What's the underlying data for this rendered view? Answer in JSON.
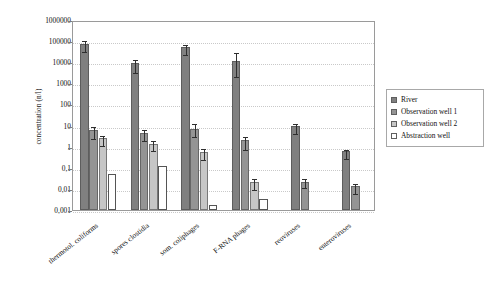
{
  "chart_data": {
    "type": "bar",
    "title": "",
    "subtitle": "",
    "xlabel": "",
    "ylabel": "concentration (n/l)",
    "yscale": "log",
    "ylim": [
      0.001,
      1000000
    ],
    "ytick_labels": [
      "1000000",
      "100000",
      "10000",
      "1000",
      "100",
      "10",
      "1",
      "0,1",
      "0,01",
      "0,001"
    ],
    "ytick_values": [
      1000000,
      100000,
      10000,
      1000,
      100,
      10,
      1,
      0.1,
      0.01,
      0.001
    ],
    "grid": true,
    "legend_position": "right",
    "categories": [
      "thermotol. coliforms",
      "spores clostidia",
      "som. coliphages",
      "F-RNA phages",
      "reoviruses",
      "enteroviruses"
    ],
    "series": [
      {
        "name": "River",
        "color": "#808080",
        "values": [
          70000,
          9000,
          50000,
          12000,
          9.5,
          0.6
        ],
        "err_low": [
          30000,
          5000,
          22000,
          9500,
          4.5,
          0.28
        ],
        "err_high": [
          50000,
          7000,
          30000,
          23000,
          5.5,
          0.3
        ]
      },
      {
        "name": "Observation well 1",
        "color": "#949494",
        "values": [
          6,
          4.5,
          7,
          2.0,
          0.022,
          0.013
        ],
        "err_low": [
          3.2,
          2.3,
          3.6,
          1.1,
          0.009,
          0.006
        ],
        "err_high": [
          5.0,
          3.0,
          7.0,
          1.6,
          0.013,
          0.009
        ]
      },
      {
        "name": "Observation well 2",
        "color": "#c6c6c6",
        "values": [
          2.5,
          1.4,
          0.55,
          0.022,
          null,
          null
        ],
        "err_low": [
          1.2,
          0.6,
          0.25,
          0.011,
          null,
          null
        ],
        "err_high": [
          1.6,
          0.9,
          0.38,
          0.016,
          null,
          null
        ]
      },
      {
        "name": "Abstraction well",
        "color": "#ffffff",
        "values": [
          0.05,
          0.12,
          0.0017,
          0.0035,
          null,
          null
        ],
        "err_low": [
          0,
          0,
          0,
          0,
          null,
          null
        ],
        "err_high": [
          0,
          0,
          0,
          0,
          null,
          null
        ]
      }
    ]
  },
  "axis": {
    "y_title": "concentration (n/l)"
  },
  "legend": {
    "items": [
      {
        "label": "River"
      },
      {
        "label": "Observation well 1"
      },
      {
        "label": "Observation well 2"
      },
      {
        "label": "Abstraction well"
      }
    ]
  }
}
